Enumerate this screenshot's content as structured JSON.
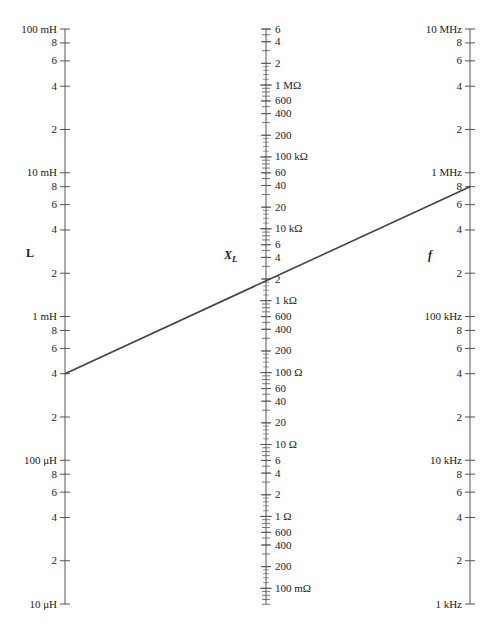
{
  "chart_data": {
    "type": "nomograph",
    "axes": [
      {
        "id": "L",
        "title": "L",
        "x": 65,
        "scale": "log",
        "y_top": 29,
        "y_bottom": 604,
        "value_top": 0.1,
        "value_bottom": 1e-05,
        "unit": "H",
        "tick_side": "left",
        "ticks": [
          {
            "v": 0.1,
            "label": "100 mH"
          },
          {
            "v": 0.08,
            "label": "8"
          },
          {
            "v": 0.06,
            "label": "6"
          },
          {
            "v": 0.04,
            "label": "4"
          },
          {
            "v": 0.02,
            "label": "2"
          },
          {
            "v": 0.01,
            "label": "10 mH"
          },
          {
            "v": 0.008,
            "label": "8"
          },
          {
            "v": 0.006,
            "label": "6"
          },
          {
            "v": 0.004,
            "label": "4"
          },
          {
            "v": 0.002,
            "label": "2"
          },
          {
            "v": 0.001,
            "label": "1 mH"
          },
          {
            "v": 0.0008,
            "label": "8"
          },
          {
            "v": 0.0006,
            "label": "6"
          },
          {
            "v": 0.0004,
            "label": "4"
          },
          {
            "v": 0.0002,
            "label": "2"
          },
          {
            "v": 0.0001,
            "label": "100 μH"
          },
          {
            "v": 8e-05,
            "label": "8"
          },
          {
            "v": 6e-05,
            "label": "6"
          },
          {
            "v": 4e-05,
            "label": "4"
          },
          {
            "v": 2e-05,
            "label": "2"
          },
          {
            "v": 1e-05,
            "label": "10 μH"
          }
        ],
        "title_pos": {
          "x": 26,
          "y": 257
        }
      },
      {
        "id": "XL",
        "title": "X",
        "title_sub": "L",
        "x": 266,
        "scale": "log",
        "y_ref": 85,
        "value_ref": 1000000,
        "px_per_decade": 71.9,
        "value_top": 6000000,
        "value_bottom": 0.06,
        "unit": "Ω",
        "tick_side": "right",
        "ticks": [
          {
            "v": 6000000,
            "label": "6"
          },
          {
            "v": 4000000,
            "label": "4"
          },
          {
            "v": 2000000,
            "label": "2"
          },
          {
            "v": 1000000,
            "label": "1 MΩ"
          },
          {
            "v": 600000,
            "label": "600"
          },
          {
            "v": 400000,
            "label": "400"
          },
          {
            "v": 200000,
            "label": "200"
          },
          {
            "v": 100000,
            "label": "100 kΩ"
          },
          {
            "v": 60000,
            "label": "60"
          },
          {
            "v": 40000,
            "label": "40"
          },
          {
            "v": 20000,
            "label": "20"
          },
          {
            "v": 10000,
            "label": "10 kΩ"
          },
          {
            "v": 6000,
            "label": "6"
          },
          {
            "v": 4000,
            "label": "4"
          },
          {
            "v": 2000,
            "label": "2"
          },
          {
            "v": 1000,
            "label": "1 kΩ"
          },
          {
            "v": 600,
            "label": "600"
          },
          {
            "v": 400,
            "label": "400"
          },
          {
            "v": 200,
            "label": "200"
          },
          {
            "v": 100,
            "label": "100 Ω"
          },
          {
            "v": 60,
            "label": "60"
          },
          {
            "v": 40,
            "label": "40"
          },
          {
            "v": 20,
            "label": "20"
          },
          {
            "v": 10,
            "label": "10 Ω"
          },
          {
            "v": 6,
            "label": "6"
          },
          {
            "v": 4,
            "label": "4"
          },
          {
            "v": 2,
            "label": "2"
          },
          {
            "v": 1,
            "label": "1 Ω"
          },
          {
            "v": 0.6,
            "label": "600"
          },
          {
            "v": 0.4,
            "label": "400"
          },
          {
            "v": 0.2,
            "label": "200"
          },
          {
            "v": 0.1,
            "label": "100 mΩ"
          }
        ],
        "title_pos": {
          "x": 224,
          "y": 259
        }
      },
      {
        "id": "f",
        "title": "f",
        "x": 470,
        "scale": "log",
        "y_top": 29,
        "y_bottom": 604,
        "value_top": 10000000,
        "value_bottom": 1000,
        "unit": "Hz",
        "tick_side": "left",
        "ticks": [
          {
            "v": 10000000,
            "label": "10 MHz"
          },
          {
            "v": 8000000,
            "label": "8"
          },
          {
            "v": 6000000,
            "label": "6"
          },
          {
            "v": 4000000,
            "label": "4"
          },
          {
            "v": 2000000,
            "label": "2"
          },
          {
            "v": 1000000,
            "label": "1 MHz"
          },
          {
            "v": 800000,
            "label": "8"
          },
          {
            "v": 600000,
            "label": "6"
          },
          {
            "v": 400000,
            "label": "4"
          },
          {
            "v": 200000,
            "label": "2"
          },
          {
            "v": 100000,
            "label": "100 kHz"
          },
          {
            "v": 80000,
            "label": "8"
          },
          {
            "v": 60000,
            "label": "6"
          },
          {
            "v": 40000,
            "label": "4"
          },
          {
            "v": 20000,
            "label": "2"
          },
          {
            "v": 10000,
            "label": "10 kHz"
          },
          {
            "v": 8000,
            "label": "8"
          },
          {
            "v": 6000,
            "label": "6"
          },
          {
            "v": 4000,
            "label": "4"
          },
          {
            "v": 2000,
            "label": "2"
          },
          {
            "v": 1000,
            "label": "1 kHz"
          }
        ],
        "title_pos": {
          "x": 428,
          "y": 259
        }
      }
    ],
    "index_line": {
      "from": {
        "axis": "L",
        "value": 0.0004,
        "label": "0.4 mH"
      },
      "to": {
        "axis": "f",
        "value": 800000,
        "label": "800 kHz"
      },
      "crosses_XL_approx": 2000,
      "color": "#444444"
    }
  }
}
